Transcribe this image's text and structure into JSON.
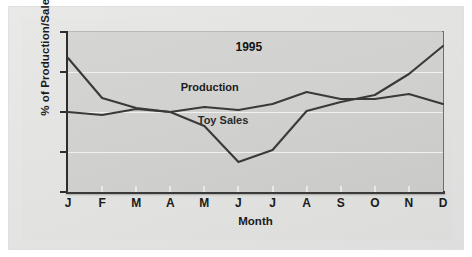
{
  "chart_data": {
    "type": "line",
    "title": "1995",
    "xlabel": "Month",
    "ylabel": "% of Production/Sales",
    "categories": [
      "J",
      "F",
      "M",
      "A",
      "M",
      "J",
      "J",
      "A",
      "S",
      "O",
      "N",
      "D"
    ],
    "ylim": [
      4,
      12
    ],
    "xlim": [
      0,
      11
    ],
    "yticks": [
      4,
      6,
      8,
      10,
      12
    ],
    "ytick_labels": [
      "4",
      "6",
      "8",
      "10",
      "12"
    ],
    "grid": true,
    "grid_axis": "y",
    "legend": "inline-annotations",
    "series": [
      {
        "name": "Production",
        "color": "#3a3a3a",
        "values": [
          8.0,
          7.85,
          8.15,
          8.0,
          8.25,
          8.1,
          8.4,
          9.0,
          8.65,
          8.65,
          8.9,
          8.4
        ]
      },
      {
        "name": "Toy Sales",
        "color": "#3a3a3a",
        "values": [
          10.7,
          8.7,
          8.2,
          8.0,
          7.3,
          5.5,
          6.1,
          8.05,
          8.5,
          8.85,
          9.9,
          11.3
        ]
      }
    ],
    "annotations": [
      {
        "text": "1995",
        "x_pct": 50.0,
        "y_pct": 6.0
      },
      {
        "text": "Production",
        "x_pct": 37.0,
        "y_pct": 33.0
      },
      {
        "text": "Toy Sales",
        "x_pct": 41.0,
        "y_pct": 54.0
      }
    ]
  },
  "axes": {
    "ylabel": "% of Production/Sales",
    "xlabel": "Month",
    "ytick_labels": [
      "12",
      "10",
      "8",
      "6",
      "4"
    ],
    "xtick_labels": [
      "J",
      "F",
      "M",
      "A",
      "M",
      "J",
      "J",
      "A",
      "S",
      "O",
      "N",
      "D"
    ]
  },
  "labels": {
    "title": "1995",
    "production": "Production",
    "toy_sales": "Toy Sales"
  }
}
